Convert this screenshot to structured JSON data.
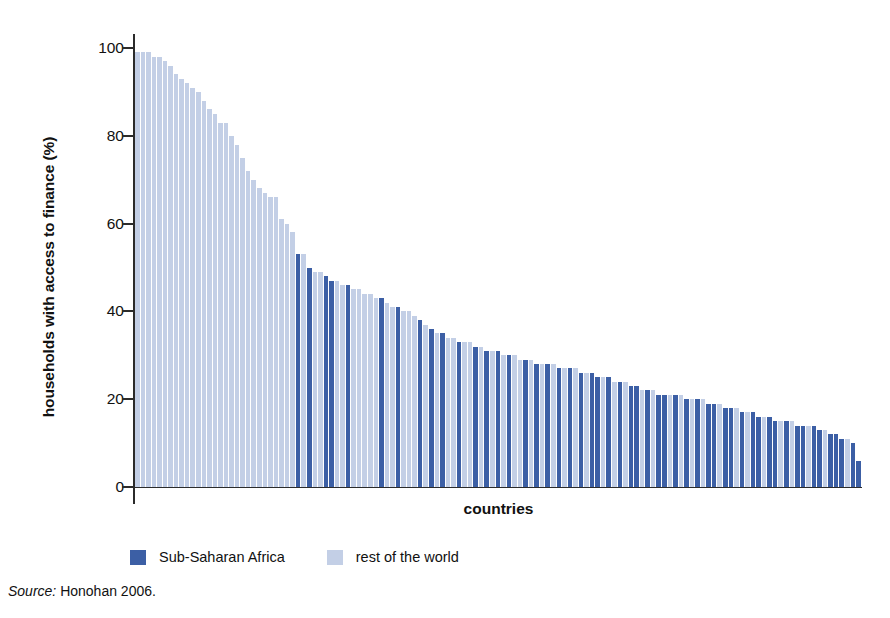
{
  "chart_data": {
    "type": "bar",
    "title": "",
    "subtitle": "",
    "xlabel": "countries",
    "ylabel": "households with access to finance (%)",
    "ylim": [
      0,
      100
    ],
    "yticks": [
      100,
      80,
      60,
      40,
      20,
      0
    ],
    "grid": false,
    "legend_position": "bottom-left",
    "sorted": "descending",
    "colors": {
      "sub_saharan_africa": "#3c5fa5",
      "rest_of_the_world": "#c3cfe6",
      "axis": "#2b2b2b",
      "background": "#ffffff"
    },
    "series": [
      {
        "name": "Sub-Saharan Africa",
        "color": "#3c5fa5"
      },
      {
        "name": "rest of the world",
        "color": "#c3cfe6"
      }
    ],
    "note": "Each bar is one country; bars sorted from highest to lowest share of households with access to finance. Group encodes whether the country is in Sub-Saharan Africa or the rest of the world.",
    "values": [
      99,
      99,
      99,
      98,
      98,
      97,
      96,
      94,
      93,
      92,
      91,
      90,
      88,
      86,
      85,
      83,
      83,
      80,
      78,
      75,
      72,
      70,
      68,
      67,
      66,
      66,
      61,
      60,
      58,
      53,
      53,
      50,
      49,
      49,
      48,
      47,
      47,
      46,
      46,
      45,
      45,
      44,
      44,
      43,
      43,
      42,
      41,
      41,
      40,
      40,
      39,
      38,
      37,
      36,
      35,
      35,
      34,
      34,
      33,
      33,
      33,
      32,
      32,
      31,
      31,
      31,
      30,
      30,
      30,
      29,
      29,
      29,
      28,
      28,
      28,
      28,
      27,
      27,
      27,
      27,
      26,
      26,
      26,
      25,
      25,
      25,
      24,
      24,
      24,
      23,
      23,
      22,
      22,
      22,
      21,
      21,
      21,
      21,
      21,
      20,
      20,
      20,
      20,
      19,
      19,
      19,
      18,
      18,
      18,
      17,
      17,
      17,
      16,
      16,
      16,
      15,
      15,
      15,
      15,
      14,
      14,
      14,
      14,
      13,
      13,
      12,
      12,
      11,
      11,
      10,
      6
    ],
    "groups": [
      "rw",
      "rw",
      "rw",
      "rw",
      "rw",
      "rw",
      "rw",
      "rw",
      "rw",
      "rw",
      "rw",
      "rw",
      "rw",
      "rw",
      "rw",
      "rw",
      "rw",
      "rw",
      "rw",
      "rw",
      "rw",
      "rw",
      "rw",
      "rw",
      "rw",
      "rw",
      "rw",
      "rw",
      "rw",
      "ssa",
      "rw",
      "ssa",
      "rw",
      "rw",
      "ssa",
      "ssa",
      "rw",
      "rw",
      "ssa",
      "rw",
      "rw",
      "rw",
      "rw",
      "rw",
      "ssa",
      "rw",
      "rw",
      "ssa",
      "rw",
      "rw",
      "rw",
      "ssa",
      "rw",
      "ssa",
      "rw",
      "ssa",
      "rw",
      "rw",
      "ssa",
      "rw",
      "rw",
      "ssa",
      "rw",
      "ssa",
      "rw",
      "ssa",
      "rw",
      "ssa",
      "rw",
      "rw",
      "ssa",
      "rw",
      "ssa",
      "rw",
      "ssa",
      "rw",
      "ssa",
      "rw",
      "ssa",
      "rw",
      "ssa",
      "rw",
      "ssa",
      "ssa",
      "rw",
      "ssa",
      "rw",
      "ssa",
      "rw",
      "ssa",
      "ssa",
      "rw",
      "ssa",
      "rw",
      "ssa",
      "ssa",
      "rw",
      "ssa",
      "rw",
      "ssa",
      "rw",
      "ssa",
      "rw",
      "ssa",
      "ssa",
      "rw",
      "ssa",
      "ssa",
      "rw",
      "ssa",
      "rw",
      "ssa",
      "ssa",
      "rw",
      "ssa",
      "ssa",
      "rw",
      "ssa",
      "rw",
      "ssa",
      "ssa",
      "rw",
      "ssa",
      "ssa",
      "rw",
      "ssa",
      "ssa",
      "ssa",
      "rw",
      "ssa",
      "ssa"
    ]
  },
  "axis": {
    "y_tick_labels": [
      "100",
      "80",
      "60",
      "40",
      "20",
      "0"
    ],
    "x_title": "countries",
    "y_title": "households with access to finance (%)"
  },
  "legend": {
    "items": [
      {
        "label": "Sub-Saharan Africa",
        "key": "ssa"
      },
      {
        "label": "rest of the world",
        "key": "rw"
      }
    ]
  },
  "source": {
    "prefix": "Source:",
    "text": "Honohan 2006."
  }
}
